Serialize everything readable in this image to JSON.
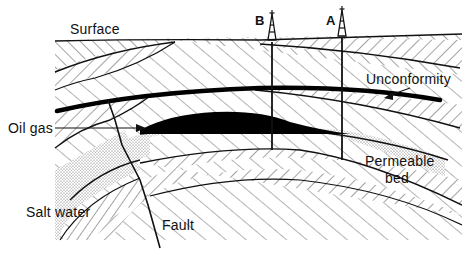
{
  "diagram": {
    "type": "geological-cross-section",
    "labels": {
      "surface": "Surface",
      "well_b": "B",
      "well_a": "A",
      "unconformity": "Unconformity",
      "oil_gas": "Oil gas",
      "permeable_bed": "Permeable",
      "permeable_bed_2": "bed",
      "salt_water": "Salt water",
      "fault": "Fault"
    },
    "features": [
      {
        "name": "surface",
        "kind": "ground-line"
      },
      {
        "name": "well-B",
        "kind": "oil-derrick",
        "x": 272
      },
      {
        "name": "well-A",
        "kind": "oil-derrick",
        "x": 342
      },
      {
        "name": "unconformity",
        "kind": "thick-boundary-line"
      },
      {
        "name": "oil-gas-trap",
        "kind": "black-filled-reservoir"
      },
      {
        "name": "permeable-bed",
        "kind": "stippled-layer"
      },
      {
        "name": "salt-water",
        "kind": "stippled-region"
      },
      {
        "name": "fault",
        "kind": "fault-line"
      }
    ],
    "colors": {
      "ink": "#111111",
      "background": "#ffffff",
      "hatch": "#333333"
    }
  }
}
